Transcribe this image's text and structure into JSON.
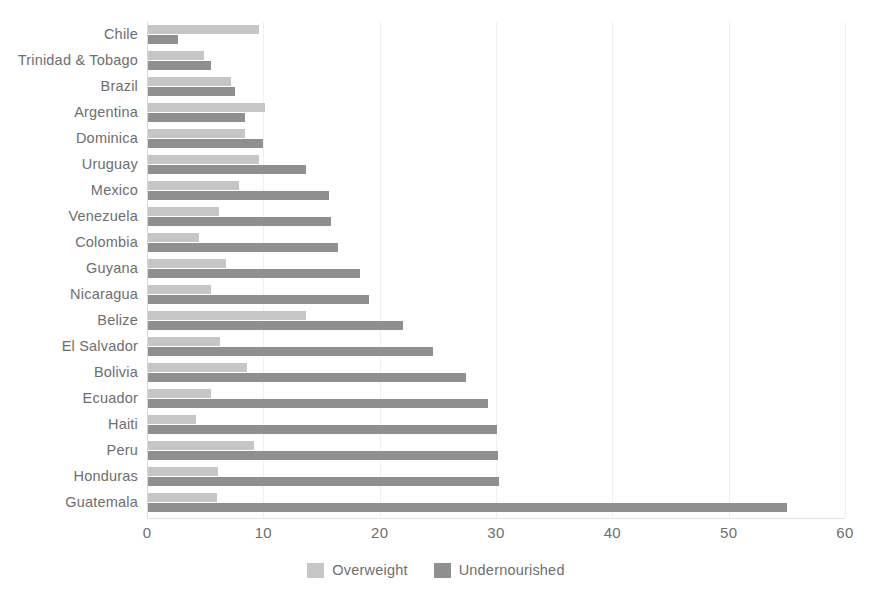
{
  "chart_data": {
    "type": "bar",
    "orientation": "horizontal",
    "title": "",
    "xlabel": "",
    "ylabel": "",
    "xlim": [
      0,
      60
    ],
    "xticks": [
      0,
      10,
      20,
      30,
      40,
      50,
      60
    ],
    "grid": true,
    "legend_position": "bottom",
    "categories": [
      "Chile",
      "Trinidad & Tobago",
      "Brazil",
      "Argentina",
      "Dominica",
      "Uruguay",
      "Mexico",
      "Venezuela",
      "Colombia",
      "Guyana",
      "Nicaragua",
      "Belize",
      "El Salvador",
      "Bolivia",
      "Ecuador",
      "Haiti",
      "Peru",
      "Honduras",
      "Guatemala"
    ],
    "series": [
      {
        "name": "Overweight",
        "color": "#c6c6c6",
        "values": [
          9.5,
          4.8,
          7.1,
          10.1,
          8.3,
          9.5,
          7.8,
          6.1,
          4.4,
          6.7,
          5.4,
          13.6,
          6.2,
          8.5,
          5.4,
          4.1,
          9.1,
          6.0,
          5.9
        ]
      },
      {
        "name": "Undernourished",
        "color": "#8f8f8f",
        "values": [
          2.6,
          5.4,
          7.5,
          8.3,
          9.9,
          13.6,
          15.6,
          15.7,
          16.3,
          18.2,
          19.0,
          21.9,
          24.5,
          27.3,
          29.2,
          30.0,
          30.1,
          30.2,
          54.9
        ]
      }
    ]
  },
  "legend": {
    "items": [
      {
        "label": "Overweight",
        "color": "#c6c6c6"
      },
      {
        "label": "Undernourished",
        "color": "#8f8f8f"
      }
    ]
  }
}
